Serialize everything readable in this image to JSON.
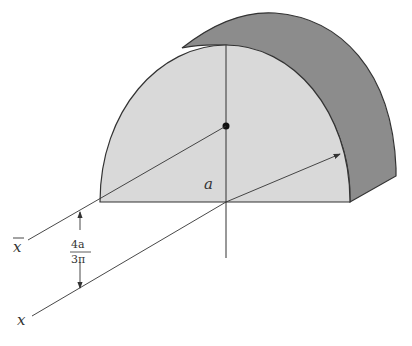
{
  "diagram": {
    "labels": {
      "radius": "a",
      "centroid_axis": "x",
      "base_axis": "x",
      "distance_numerator": "4a",
      "distance_denominator": "3π"
    },
    "colors": {
      "front_face": "#d9d9d9",
      "curved_surface": "#8c8c8c",
      "stroke": "#333333",
      "background": "#ffffff"
    }
  }
}
